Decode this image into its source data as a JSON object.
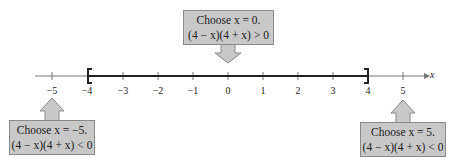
{
  "diagram": {
    "type": "number-line",
    "axis_label": "x",
    "ticks": [
      "−5",
      "−4",
      "−3",
      "−2",
      "−1",
      "0",
      "1",
      "2",
      "3",
      "4",
      "5"
    ],
    "tick_values": [
      -5,
      -4,
      -3,
      -2,
      -1,
      0,
      1,
      2,
      3,
      4,
      5
    ],
    "interval": {
      "left": -4,
      "right": 4,
      "left_bracket": "[",
      "right_bracket": "]",
      "closed": true
    },
    "callouts": [
      {
        "id": "middle",
        "line1": "Choose x = 0.",
        "line2": "(4 − x)(4 + x) > 0",
        "test_value": 0,
        "position": "above"
      },
      {
        "id": "left",
        "line1": "Choose x = −5.",
        "line2": "(4 − x)(4 + x) < 0",
        "test_value": -5,
        "position": "below"
      },
      {
        "id": "right",
        "line1": "Choose x = 5.",
        "line2": "(4 − x)(4 + x) < 0",
        "test_value": 5,
        "position": "below"
      }
    ],
    "colors": {
      "box_fill": "#c8c8c8",
      "box_border": "#8a8a8a",
      "line": "#222222",
      "axis": "#777777"
    }
  }
}
